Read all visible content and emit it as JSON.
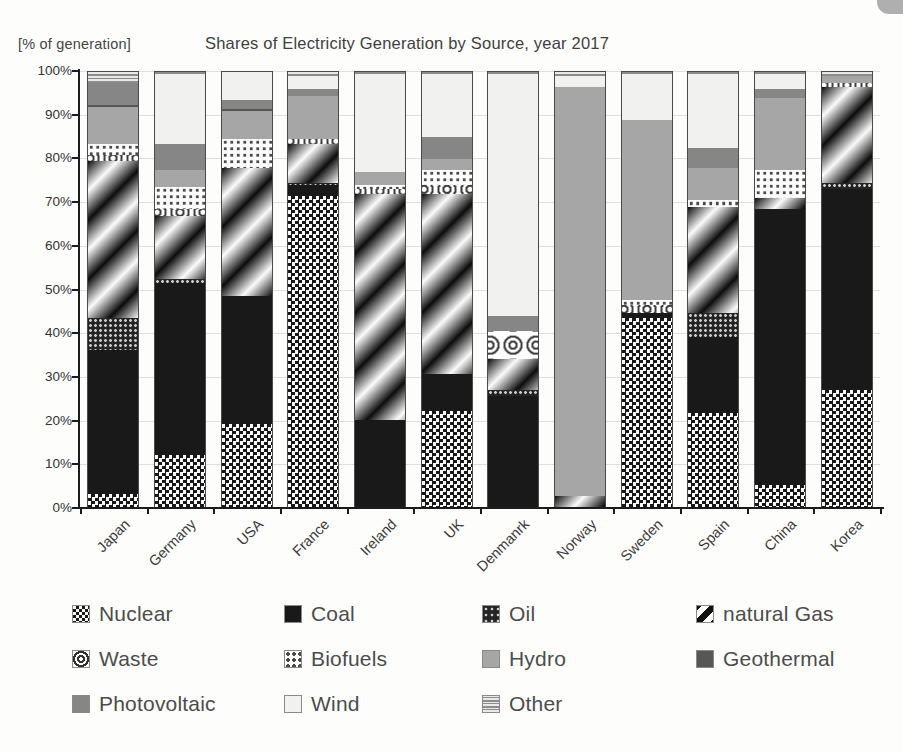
{
  "header": {
    "y_axis_note": "[% of  generation]",
    "title": "Shares of Electricity Generation by Source,  year 2017"
  },
  "chart_data": {
    "type": "bar",
    "stacked": true,
    "unit": "% of generation",
    "title": "Shares of Electricity Generation by Source,  year 2017",
    "ylim": [
      0,
      100
    ],
    "ytick_step": 10,
    "ytick_labels": [
      "0%",
      "10%",
      "20%",
      "30%",
      "40%",
      "50%",
      "60%",
      "70%",
      "80%",
      "90%",
      "100%"
    ],
    "grid": true,
    "legend_position": "bottom",
    "categories": [
      "Japan",
      "Germany",
      "USA",
      "France",
      "Ireland",
      "UK",
      "Denmanrk",
      "Norway",
      "Sweden",
      "Spain",
      "China",
      "Korea"
    ],
    "series": [
      {
        "name": "Nuclear",
        "key": "nuclear",
        "pattern": "black-white-checkerboard",
        "values": [
          3,
          12,
          19,
          71.5,
          0,
          22,
          0,
          0,
          43.5,
          21.5,
          5,
          27
        ]
      },
      {
        "name": "Coal",
        "key": "coal",
        "pattern": "solid-black",
        "values": [
          33,
          39.5,
          29.5,
          2.5,
          20,
          8.5,
          25.5,
          0,
          1,
          17.5,
          63.5,
          46
        ]
      },
      {
        "name": "Oil",
        "key": "oil",
        "pattern": "dark-crosshatch",
        "values": [
          7.5,
          1,
          0,
          0.5,
          0,
          0,
          1.5,
          0,
          0,
          5.5,
          0,
          1.5
        ]
      },
      {
        "name": "natural Gas",
        "key": "gas",
        "pattern": "diagonal-gradient-stripes",
        "values": [
          36,
          14.5,
          29.5,
          9,
          52,
          41.5,
          7,
          2.5,
          0,
          24.5,
          2.5,
          22
        ]
      },
      {
        "name": "Waste",
        "key": "waste",
        "pattern": "white-concentric-circles",
        "values": [
          1.5,
          1.5,
          0,
          1,
          1,
          2,
          6.5,
          0,
          2,
          0,
          0,
          1
        ]
      },
      {
        "name": "Biofuels",
        "key": "biofuels",
        "pattern": "white-dark-dots",
        "values": [
          2.5,
          5,
          6.5,
          0,
          1,
          3.5,
          0,
          0,
          1,
          1.5,
          6.5,
          0
        ]
      },
      {
        "name": "Hydro",
        "key": "hydro",
        "pattern": "solid-gray",
        "color": "#a6a6a6",
        "values": [
          8.5,
          4,
          6.5,
          10,
          3,
          2.5,
          0,
          94,
          41.5,
          7.5,
          16.5,
          1.5
        ]
      },
      {
        "name": "Geothermal",
        "key": "geothermal",
        "pattern": "solid-dark-gray",
        "color": "#575757",
        "values": [
          0.5,
          0,
          0.5,
          0,
          0,
          0,
          0,
          0,
          0,
          0,
          0,
          0
        ]
      },
      {
        "name": "Photovoltaic",
        "key": "pv",
        "pattern": "solid-medium-gray",
        "color": "#868686",
        "values": [
          5,
          6,
          2,
          1.5,
          0,
          5,
          3.5,
          0,
          0,
          4.5,
          2,
          0
        ]
      },
      {
        "name": "Wind",
        "key": "wind",
        "pattern": "solid-near-white",
        "color": "#f1f1f0",
        "values": [
          0,
          16,
          6.5,
          3,
          22.5,
          14.5,
          55.5,
          2.5,
          10.5,
          17,
          3.5,
          0
        ]
      },
      {
        "name": "Other",
        "key": "other",
        "pattern": "gray-wavy-lines",
        "values": [
          2.5,
          0.5,
          0,
          1,
          0.5,
          0.5,
          0.5,
          1,
          0.5,
          0.5,
          0.5,
          1
        ]
      }
    ]
  },
  "legend": {
    "items": [
      {
        "label": "Nuclear",
        "key": "nuclear"
      },
      {
        "label": "Coal",
        "key": "coal"
      },
      {
        "label": "Oil",
        "key": "oil"
      },
      {
        "label": "natural Gas",
        "key": "gas"
      },
      {
        "label": "Waste",
        "key": "waste"
      },
      {
        "label": "Biofuels",
        "key": "biofuels"
      },
      {
        "label": "Hydro",
        "key": "hydro"
      },
      {
        "label": "Geothermal",
        "key": "geothermal"
      },
      {
        "label": "Photovoltaic",
        "key": "pv"
      },
      {
        "label": "Wind",
        "key": "wind"
      },
      {
        "label": "Other",
        "key": "other"
      }
    ]
  }
}
